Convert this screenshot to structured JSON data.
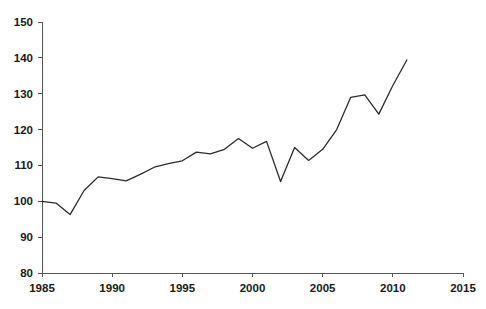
{
  "chart_data": {
    "type": "line",
    "title": "",
    "subtitle": "",
    "xlabel": "",
    "ylabel": "",
    "xlim": [
      1985,
      2015
    ],
    "ylim": [
      80,
      150
    ],
    "grid": false,
    "legend": false,
    "legend_position": "none",
    "line_color": "#2b2b2b",
    "axis_color": "#555555",
    "text_color": "#1a1a1a",
    "x_ticks": [
      1985,
      1990,
      1995,
      2000,
      2005,
      2010,
      2015
    ],
    "x_tick_labels": [
      "1985",
      "1990",
      "1995",
      "2000",
      "2005",
      "2010",
      "2015"
    ],
    "y_ticks": [
      80,
      90,
      100,
      110,
      120,
      130,
      140,
      150
    ],
    "y_tick_labels": [
      "80",
      "90",
      "100",
      "110",
      "120",
      "130",
      "140",
      "150"
    ],
    "x": [
      1985,
      1986,
      1987,
      1988,
      1989,
      1990,
      1991,
      1992,
      1993,
      1994,
      1995,
      1996,
      1997,
      1998,
      1999,
      2000,
      2001,
      2002,
      2003,
      2004,
      2005,
      2006,
      2007,
      2008,
      2009,
      2010,
      2011
    ],
    "values": [
      100.0,
      99.5,
      96.3,
      103.0,
      106.8,
      106.3,
      105.7,
      107.5,
      109.5,
      110.5,
      111.3,
      113.7,
      113.2,
      114.5,
      117.5,
      114.8,
      116.7,
      105.5,
      115.0,
      111.4,
      114.5,
      120.0,
      129.0,
      129.7,
      124.3,
      132.3,
      139.4
    ],
    "series": [
      {
        "name": "series-1",
        "color": "#2b2b2b",
        "values": [
          100.0,
          99.5,
          96.3,
          103.0,
          106.8,
          106.3,
          105.7,
          107.5,
          109.5,
          110.5,
          111.3,
          113.7,
          113.2,
          114.5,
          117.5,
          114.8,
          116.7,
          105.5,
          115.0,
          111.4,
          114.5,
          120.0,
          129.0,
          129.7,
          124.3,
          132.3,
          139.4
        ]
      }
    ]
  }
}
